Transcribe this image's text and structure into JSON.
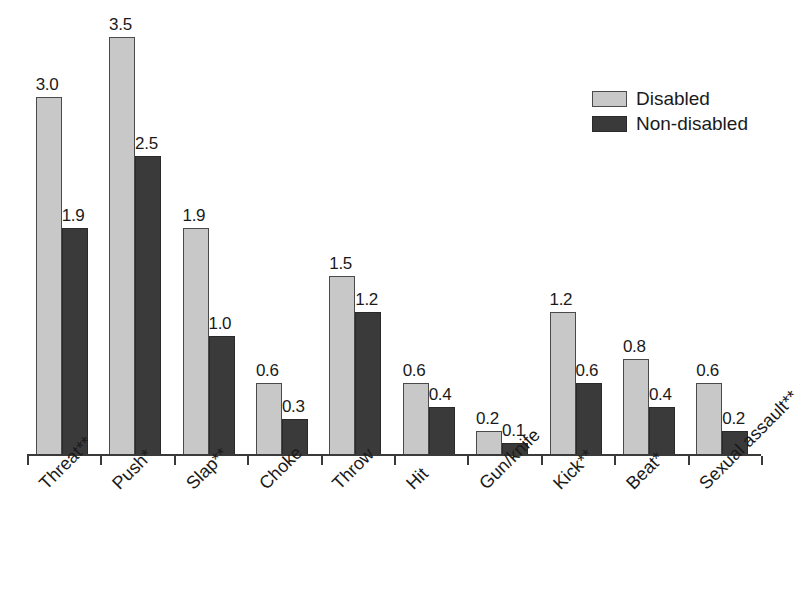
{
  "chart_data": {
    "type": "bar",
    "title": "",
    "subtitle": "",
    "xlabel": "",
    "ylabel": "",
    "ylim": [
      0,
      3.8
    ],
    "grid": false,
    "legend_position": "top-right",
    "orientation": "vertical",
    "grouping": "grouped",
    "categories": [
      "Threat**",
      "Push*",
      "Slap**",
      "Choke",
      "Throw",
      "Hit",
      "Gun/knife",
      "Kick**",
      "Beat*",
      "Sexual assault**"
    ],
    "series": [
      {
        "name": "Disabled",
        "color": "#c8c8c8",
        "values": [
          3.0,
          3.5,
          1.9,
          0.6,
          1.5,
          0.6,
          0.2,
          1.2,
          0.8,
          0.6
        ],
        "labels": [
          "3.0",
          "3.5",
          "1.9",
          "0.6",
          "1.5",
          "0.6",
          "0.2",
          "1.2",
          "0.8",
          "0.6"
        ]
      },
      {
        "name": "Non-disabled",
        "color": "#3a3a3a",
        "values": [
          1.9,
          2.5,
          1.0,
          0.3,
          1.2,
          0.4,
          0.1,
          0.6,
          0.4,
          0.2
        ],
        "labels": [
          "1.9",
          "2.5",
          "1.0",
          "0.3",
          "1.2",
          "0.4",
          "0.1",
          "0.6",
          "0.4",
          "0.2"
        ]
      }
    ],
    "annotations": {
      "significance_markers": [
        "*",
        "**"
      ]
    }
  },
  "legend": {
    "items": [
      {
        "label": "Disabled",
        "swatch": "light-gray-swatch-icon"
      },
      {
        "label": "Non-disabled",
        "swatch": "dark-gray-swatch-icon"
      }
    ]
  },
  "axis": {
    "baseline_color": "#3a3a3a",
    "tick_count": 11
  }
}
